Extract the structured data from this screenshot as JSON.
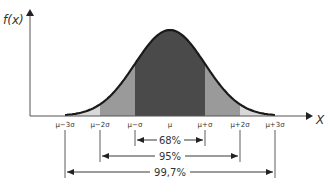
{
  "chart_data": {
    "type": "area",
    "title": "",
    "xlabel": "X",
    "ylabel": "f(x)",
    "distribution": "normal",
    "tick_labels": [
      "μ−3σ",
      "μ−2σ",
      "μ−σ",
      "μ",
      "μ+σ",
      "μ+2σ",
      "μ+3σ"
    ],
    "tick_values_sigma": [
      -3,
      -2,
      -1,
      0,
      1,
      2,
      3
    ],
    "bands": [
      {
        "range_sigma": [
          -1,
          1
        ],
        "label": "68%",
        "color": "#4a4a4a"
      },
      {
        "range_sigma": [
          -2,
          2
        ],
        "label": "95%",
        "color": "#9a9a9a"
      },
      {
        "range_sigma": [
          -3,
          3
        ],
        "label": "99,7%",
        "color": "#d8d8d8"
      }
    ],
    "grid": false,
    "legend": "none"
  },
  "axes": {
    "y_label": "f(x)",
    "x_label": "X"
  },
  "annotations": {
    "band_68": "68%",
    "band_95": "95%",
    "band_997": "99,7%"
  },
  "colors": {
    "inner": "#4a4a4a",
    "middle": "#9a9a9a",
    "outer": "#d8d8d8",
    "curve": "#1a1a1a",
    "axis": "#555555"
  }
}
